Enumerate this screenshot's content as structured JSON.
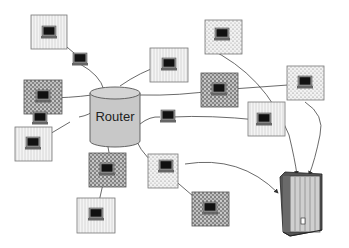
{
  "diagram": {
    "router": {
      "label": "Router",
      "x": 90,
      "y": 88,
      "w": 50,
      "h": 58,
      "fill": "#c8c8c8"
    },
    "server": {
      "label": "server",
      "x": 280,
      "y": 172
    },
    "nodes": [
      {
        "id": "n1",
        "x": 31,
        "y": 15,
        "w": 36,
        "h": 34,
        "pattern": "lines"
      },
      {
        "id": "n2",
        "x": 24,
        "y": 80,
        "w": 38,
        "h": 34,
        "pattern": "dense"
      },
      {
        "id": "n3",
        "x": 15,
        "y": 127,
        "w": 37,
        "h": 34,
        "pattern": "lines"
      },
      {
        "id": "n4",
        "x": 89,
        "y": 153,
        "w": 37,
        "h": 34,
        "pattern": "dense"
      },
      {
        "id": "n5",
        "x": 77,
        "y": 198,
        "w": 38,
        "h": 35,
        "pattern": "lines"
      },
      {
        "id": "n6",
        "x": 150,
        "y": 48,
        "w": 38,
        "h": 34,
        "pattern": "lines"
      },
      {
        "id": "n7",
        "x": 205,
        "y": 20,
        "w": 37,
        "h": 34,
        "pattern": "dots"
      },
      {
        "id": "n8",
        "x": 201,
        "y": 73,
        "w": 37,
        "h": 34,
        "pattern": "dense"
      },
      {
        "id": "n9",
        "x": 287,
        "y": 66,
        "w": 37,
        "h": 34,
        "pattern": "dots"
      },
      {
        "id": "n10",
        "x": 248,
        "y": 102,
        "w": 37,
        "h": 34,
        "pattern": "lines"
      },
      {
        "id": "n11",
        "x": 148,
        "y": 154,
        "w": 30,
        "h": 34,
        "pattern": "dots"
      },
      {
        "id": "n12",
        "x": 192,
        "y": 192,
        "w": 37,
        "h": 34,
        "pattern": "dense"
      }
    ],
    "standalone_computers": [
      {
        "id": "c1",
        "x": 72,
        "y": 55
      },
      {
        "id": "c2",
        "x": 70,
        "y": 115
      },
      {
        "id": "c3",
        "x": 160,
        "y": 112
      }
    ]
  }
}
